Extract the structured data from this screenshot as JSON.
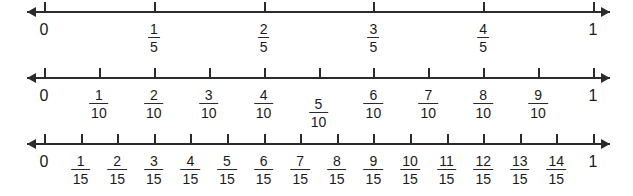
{
  "figure": {
    "background_color": "#ffffff",
    "line_color": "#2b2b2b",
    "text_color": "#1a1a1a",
    "width": 633,
    "height": 196
  },
  "chart_data": {
    "type": "number-line",
    "axis_min": 0,
    "axis_max": 1,
    "grid": false,
    "legend": null,
    "lines": [
      {
        "name": "fifths",
        "denominator": 5,
        "axis_y": 11,
        "start_label": "0",
        "end_label": "1",
        "ticks": [
          {
            "value": 0,
            "kind": "whole",
            "text": "0"
          },
          {
            "value": 0.2,
            "kind": "fraction",
            "numerator": "1",
            "denominator": "5"
          },
          {
            "value": 0.4,
            "kind": "fraction",
            "numerator": "2",
            "denominator": "5"
          },
          {
            "value": 0.6,
            "kind": "fraction",
            "numerator": "3",
            "denominator": "5"
          },
          {
            "value": 0.8,
            "kind": "fraction",
            "numerator": "4",
            "denominator": "5"
          },
          {
            "value": 1,
            "kind": "whole",
            "text": "1"
          }
        ]
      },
      {
        "name": "tenths",
        "denominator": 10,
        "axis_y": 77,
        "start_label": "0",
        "end_label": "1",
        "ticks": [
          {
            "value": 0,
            "kind": "whole",
            "text": "0"
          },
          {
            "value": 0.1,
            "kind": "fraction",
            "numerator": "1",
            "denominator": "10"
          },
          {
            "value": 0.2,
            "kind": "fraction",
            "numerator": "2",
            "denominator": "10"
          },
          {
            "value": 0.3,
            "kind": "fraction",
            "numerator": "3",
            "denominator": "10"
          },
          {
            "value": 0.4,
            "kind": "fraction",
            "numerator": "4",
            "denominator": "10"
          },
          {
            "value": 0.5,
            "kind": "fraction",
            "numerator": "5",
            "denominator": "10",
            "drop": 9
          },
          {
            "value": 0.6,
            "kind": "fraction",
            "numerator": "6",
            "denominator": "10"
          },
          {
            "value": 0.7,
            "kind": "fraction",
            "numerator": "7",
            "denominator": "10"
          },
          {
            "value": 0.8,
            "kind": "fraction",
            "numerator": "8",
            "denominator": "10"
          },
          {
            "value": 0.9,
            "kind": "fraction",
            "numerator": "9",
            "denominator": "10"
          },
          {
            "value": 1,
            "kind": "whole",
            "text": "1"
          }
        ]
      },
      {
        "name": "fifteenths",
        "denominator": 15,
        "axis_y": 143,
        "start_label": "0",
        "end_label": "1",
        "ticks": [
          {
            "value": 0,
            "kind": "whole",
            "text": "0"
          },
          {
            "value": 0.0667,
            "kind": "fraction",
            "numerator": "1",
            "denominator": "15"
          },
          {
            "value": 0.1333,
            "kind": "fraction",
            "numerator": "2",
            "denominator": "15"
          },
          {
            "value": 0.2,
            "kind": "fraction",
            "numerator": "3",
            "denominator": "15"
          },
          {
            "value": 0.2667,
            "kind": "fraction",
            "numerator": "4",
            "denominator": "15"
          },
          {
            "value": 0.3333,
            "kind": "fraction",
            "numerator": "5",
            "denominator": "15"
          },
          {
            "value": 0.4,
            "kind": "fraction",
            "numerator": "6",
            "denominator": "15"
          },
          {
            "value": 0.4667,
            "kind": "fraction",
            "numerator": "7",
            "denominator": "15"
          },
          {
            "value": 0.5333,
            "kind": "fraction",
            "numerator": "8",
            "denominator": "15"
          },
          {
            "value": 0.6,
            "kind": "fraction",
            "numerator": "9",
            "denominator": "15"
          },
          {
            "value": 0.6667,
            "kind": "fraction",
            "numerator": "10",
            "denominator": "15"
          },
          {
            "value": 0.7333,
            "kind": "fraction",
            "numerator": "11",
            "denominator": "15"
          },
          {
            "value": 0.8,
            "kind": "fraction",
            "numerator": "12",
            "denominator": "15"
          },
          {
            "value": 0.8667,
            "kind": "fraction",
            "numerator": "13",
            "denominator": "15"
          },
          {
            "value": 0.9333,
            "kind": "fraction",
            "numerator": "14",
            "denominator": "15"
          },
          {
            "value": 1,
            "kind": "whole",
            "text": "1"
          }
        ]
      }
    ]
  },
  "geometry": {
    "zero_x": 44,
    "one_x": 593,
    "arrow_left_tip_x": 27,
    "arrow_right_tip_x": 610,
    "tick_rise": 9,
    "tick_drop": 2,
    "label_offset": 11
  }
}
